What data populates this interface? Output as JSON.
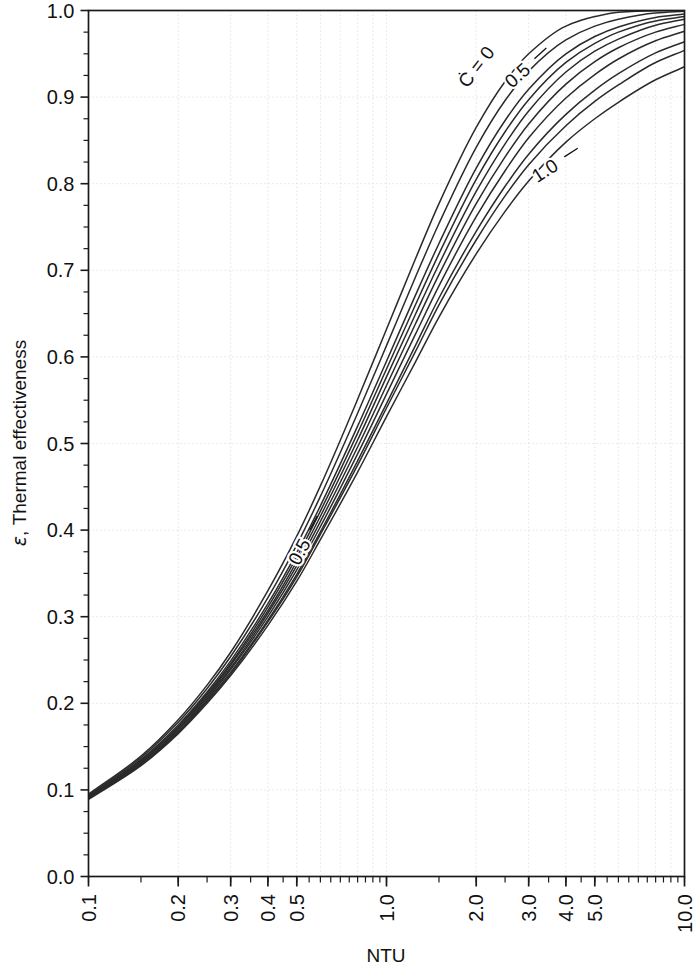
{
  "chart_data": {
    "type": "line",
    "title": "",
    "subtitle": "",
    "xlabel": "NTU",
    "ylabel": "ε, Thermal effectiveness",
    "ylabel_symbol": "ε",
    "ylabel_rest": ", Thermal effectiveness",
    "xscale": "log",
    "yscale": "linear",
    "xlim": [
      0.1,
      10.0
    ],
    "ylim": [
      0.0,
      1.0
    ],
    "grid": true,
    "grid_style": "dotted-light",
    "legend": "none",
    "legend_position": "inline-curve-labels",
    "xticks": [
      0.1,
      0.2,
      0.3,
      0.4,
      0.5,
      1.0,
      2.0,
      3.0,
      4.0,
      5.0,
      10.0
    ],
    "xtick_labels": [
      "0.1",
      "0.2",
      "0.3",
      "0.4",
      "0.5",
      "1.0",
      "2.0",
      "3.0",
      "4.0",
      "5.0",
      "10.0"
    ],
    "xtick_rotation": -90,
    "yticks": [
      0.0,
      0.1,
      0.2,
      0.3,
      0.4,
      0.5,
      0.6,
      0.7,
      0.8,
      0.9,
      1.0
    ],
    "ytick_labels": [
      "0.0",
      "0.1",
      "0.2",
      "0.3",
      "0.4",
      "0.5",
      "0.6",
      "0.7",
      "0.8",
      "0.9",
      "1.0"
    ],
    "yminor_step": 0.025,
    "parameter_name": "C*",
    "annotations": [
      {
        "text": "Ċ = 0",
        "x": 2.0,
        "y": 0.935,
        "rotation": -52,
        "leader": false
      },
      {
        "text": "0.5",
        "x": 2.75,
        "y": 0.925,
        "rotation": -42,
        "leader": true
      },
      {
        "text": "1.0",
        "x": 3.4,
        "y": 0.815,
        "rotation": -33,
        "leader": true
      },
      {
        "text": "0.5",
        "x": 0.51,
        "y": 0.375,
        "rotation": -62,
        "leader": true
      }
    ],
    "series": [
      {
        "name": "C* = 0",
        "cstar": 0.0,
        "x": [
          0.1,
          0.15,
          0.2,
          0.25,
          0.3,
          0.4,
          0.5,
          0.6,
          0.8,
          1.0,
          1.25,
          1.5,
          2.0,
          2.5,
          3.0,
          4.0,
          5.0,
          6.0,
          8.0,
          10.0
        ],
        "y": [
          0.095,
          0.139,
          0.181,
          0.221,
          0.259,
          0.33,
          0.393,
          0.451,
          0.551,
          0.632,
          0.713,
          0.777,
          0.865,
          0.918,
          0.95,
          0.982,
          0.993,
          0.998,
          0.9997,
          1.0
        ]
      },
      {
        "name": "C* = 0.2",
        "cstar": 0.2,
        "x": [
          0.1,
          0.15,
          0.2,
          0.25,
          0.3,
          0.4,
          0.5,
          0.6,
          0.8,
          1.0,
          1.25,
          1.5,
          2.0,
          2.5,
          3.0,
          4.0,
          5.0,
          6.0,
          8.0,
          10.0
        ],
        "y": [
          0.094,
          0.137,
          0.178,
          0.217,
          0.254,
          0.322,
          0.383,
          0.439,
          0.535,
          0.613,
          0.692,
          0.754,
          0.842,
          0.896,
          0.93,
          0.966,
          0.982,
          0.99,
          0.997,
          0.999
        ]
      },
      {
        "name": "C* = 0.4",
        "cstar": 0.4,
        "x": [
          0.1,
          0.15,
          0.2,
          0.25,
          0.3,
          0.4,
          0.5,
          0.6,
          0.8,
          1.0,
          1.25,
          1.5,
          2.0,
          2.5,
          3.0,
          4.0,
          5.0,
          6.0,
          8.0,
          10.0
        ],
        "y": [
          0.093,
          0.135,
          0.175,
          0.213,
          0.249,
          0.315,
          0.374,
          0.428,
          0.52,
          0.595,
          0.671,
          0.731,
          0.818,
          0.873,
          0.909,
          0.95,
          0.97,
          0.981,
          0.992,
          0.996
        ]
      },
      {
        "name": "C* = 0.5",
        "cstar": 0.5,
        "x": [
          0.1,
          0.15,
          0.2,
          0.25,
          0.3,
          0.4,
          0.5,
          0.6,
          0.8,
          1.0,
          1.25,
          1.5,
          2.0,
          2.5,
          3.0,
          4.0,
          5.0,
          6.0,
          8.0,
          10.0
        ],
        "y": [
          0.092,
          0.134,
          0.173,
          0.211,
          0.246,
          0.311,
          0.369,
          0.422,
          0.512,
          0.586,
          0.66,
          0.719,
          0.805,
          0.86,
          0.897,
          0.94,
          0.962,
          0.975,
          0.988,
          0.993
        ]
      },
      {
        "name": "C* = 0.6",
        "cstar": 0.6,
        "x": [
          0.1,
          0.15,
          0.2,
          0.25,
          0.3,
          0.4,
          0.5,
          0.6,
          0.8,
          1.0,
          1.25,
          1.5,
          2.0,
          2.5,
          3.0,
          4.0,
          5.0,
          6.0,
          8.0,
          10.0
        ],
        "y": [
          0.092,
          0.133,
          0.172,
          0.209,
          0.244,
          0.307,
          0.364,
          0.416,
          0.504,
          0.577,
          0.649,
          0.707,
          0.791,
          0.846,
          0.884,
          0.929,
          0.953,
          0.967,
          0.983,
          0.99
        ]
      },
      {
        "name": "C* = 0.7",
        "cstar": 0.7,
        "x": [
          0.1,
          0.15,
          0.2,
          0.25,
          0.3,
          0.4,
          0.5,
          0.6,
          0.8,
          1.0,
          1.25,
          1.5,
          2.0,
          2.5,
          3.0,
          4.0,
          5.0,
          6.0,
          8.0,
          10.0
        ],
        "y": [
          0.091,
          0.132,
          0.17,
          0.207,
          0.241,
          0.304,
          0.359,
          0.41,
          0.496,
          0.567,
          0.638,
          0.695,
          0.777,
          0.831,
          0.869,
          0.915,
          0.941,
          0.957,
          0.975,
          0.984
        ]
      },
      {
        "name": "C* = 0.8",
        "cstar": 0.8,
        "x": [
          0.1,
          0.15,
          0.2,
          0.25,
          0.3,
          0.4,
          0.5,
          0.6,
          0.8,
          1.0,
          1.25,
          1.5,
          2.0,
          2.5,
          3.0,
          4.0,
          5.0,
          6.0,
          8.0,
          10.0
        ],
        "y": [
          0.091,
          0.131,
          0.169,
          0.205,
          0.239,
          0.3,
          0.354,
          0.404,
          0.488,
          0.557,
          0.626,
          0.682,
          0.762,
          0.815,
          0.853,
          0.899,
          0.926,
          0.944,
          0.965,
          0.976
        ]
      },
      {
        "name": "C* = 0.9",
        "cstar": 0.9,
        "x": [
          0.1,
          0.15,
          0.2,
          0.25,
          0.3,
          0.4,
          0.5,
          0.6,
          0.8,
          1.0,
          1.25,
          1.5,
          2.0,
          2.5,
          3.0,
          4.0,
          5.0,
          6.0,
          8.0,
          10.0
        ],
        "y": [
          0.09,
          0.13,
          0.167,
          0.203,
          0.236,
          0.296,
          0.349,
          0.398,
          0.48,
          0.546,
          0.613,
          0.668,
          0.745,
          0.797,
          0.834,
          0.88,
          0.908,
          0.927,
          0.951,
          0.964
        ]
      },
      {
        "name": "C* = 0.95",
        "cstar": 0.95,
        "x": [
          0.1,
          0.15,
          0.2,
          0.25,
          0.3,
          0.4,
          0.5,
          0.6,
          0.8,
          1.0,
          1.25,
          1.5,
          2.0,
          2.5,
          3.0,
          4.0,
          5.0,
          6.0,
          8.0,
          10.0
        ],
        "y": [
          0.09,
          0.129,
          0.166,
          0.202,
          0.234,
          0.294,
          0.346,
          0.395,
          0.475,
          0.541,
          0.606,
          0.66,
          0.735,
          0.786,
          0.822,
          0.867,
          0.895,
          0.914,
          0.94,
          0.954
        ]
      },
      {
        "name": "C* = 1.0",
        "cstar": 1.0,
        "x": [
          0.1,
          0.15,
          0.2,
          0.25,
          0.3,
          0.4,
          0.5,
          0.6,
          0.8,
          1.0,
          1.25,
          1.5,
          2.0,
          2.5,
          3.0,
          4.0,
          5.0,
          6.0,
          8.0,
          10.0
        ],
        "y": [
          0.089,
          0.128,
          0.165,
          0.2,
          0.232,
          0.29,
          0.341,
          0.389,
          0.467,
          0.531,
          0.594,
          0.646,
          0.719,
          0.768,
          0.803,
          0.848,
          0.875,
          0.894,
          0.92,
          0.935
        ]
      }
    ],
    "colors": {
      "curve": "#2b2b2b",
      "axis": "#1a1a1a",
      "grid": "#d9d9d9",
      "background": "#ffffff",
      "text": "#111111"
    }
  }
}
